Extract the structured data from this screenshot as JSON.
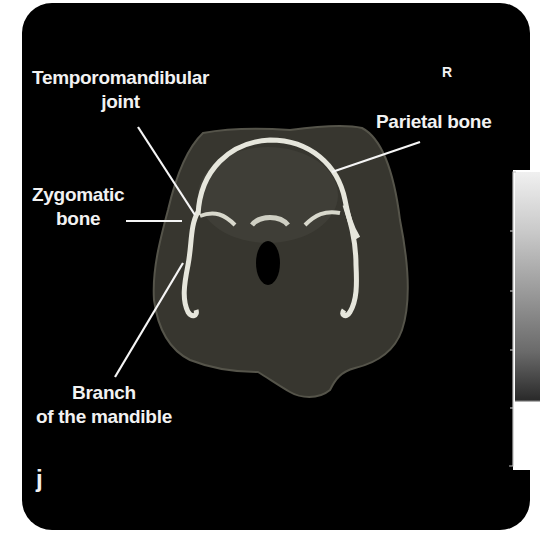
{
  "figure": {
    "panel_letter": "j",
    "orientation_marker": "R",
    "modality": "CT axial slice",
    "labels": [
      {
        "id": "tmj",
        "lines": [
          "Temporomandibular",
          "joint"
        ]
      },
      {
        "id": "zygomatic",
        "lines": [
          "Zygomatic",
          "bone"
        ]
      },
      {
        "id": "parietal",
        "lines": [
          "Parietal bone"
        ]
      },
      {
        "id": "mandible",
        "lines": [
          "Branch",
          "of the mandible"
        ]
      }
    ],
    "colors": {
      "background": "#000000",
      "label_text": "#f2f2f2",
      "leader_line": "#f5f5f5",
      "bone": "#e8e8e0",
      "soft_tissue": "#3c3b36"
    },
    "grayscale_bar_ticks": 6
  }
}
